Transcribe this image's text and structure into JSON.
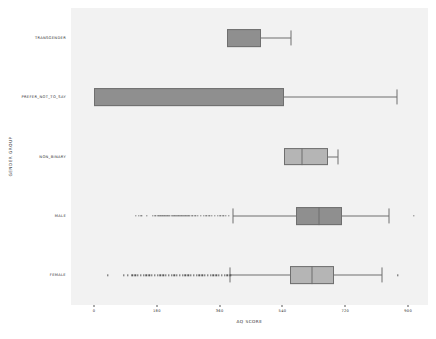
{
  "chart_data": {
    "type": "box",
    "title": "",
    "xlabel": "AQ SCORE",
    "ylabel": "GENDER GROUP",
    "orientation": "horizontal",
    "grid": false,
    "legend": null,
    "xlim": [
      -66,
      957
    ],
    "xticks": [
      0,
      180,
      360,
      540,
      720,
      900
    ],
    "xtick_labels": [
      "0",
      "180",
      "360",
      "540",
      "720",
      "900"
    ],
    "categories": [
      "TRANSGENDER",
      "PREFER_NOT_TO_SAY",
      "NON_BINARY",
      "MALE",
      "FEMALE"
    ],
    "boxes": [
      {
        "label": "TRANSGENDER",
        "whisker_low": 382,
        "q1": 382,
        "median": 382,
        "q3": 478,
        "whisker_high": 565,
        "fill": "#8f8f8f",
        "fliers": []
      },
      {
        "label": "PREFER_NOT_TO_SAY",
        "whisker_low": 0,
        "q1": 0,
        "median": 0,
        "q3": 545,
        "whisker_high": 868,
        "fill": "#8f8f8f",
        "fliers": []
      },
      {
        "label": "NON_BINARY",
        "whisker_low": 545,
        "q1": 545,
        "median": 596,
        "q3": 671,
        "whisker_high": 700,
        "fill": "#b5b5b5",
        "fliers": []
      },
      {
        "label": "MALE",
        "whisker_low": 398,
        "q1": 579,
        "median": 645,
        "q3": 711,
        "whisker_high": 846,
        "fill": "#8f8f8f",
        "fliers": [
          120,
          128,
          136,
          152,
          168,
          176,
          184,
          190,
          196,
          201,
          206,
          210,
          214,
          218,
          222,
          226,
          230,
          234,
          238,
          242,
          246,
          250,
          254,
          258,
          262,
          266,
          270,
          274,
          282,
          290,
          298,
          306,
          314,
          322,
          330,
          338,
          346,
          354,
          362,
          370,
          378,
          386,
          916
        ]
      },
      {
        "label": "FEMALE",
        "whisker_low": 390,
        "q1": 561,
        "median": 626,
        "q3": 689,
        "whisker_high": 826,
        "fill": "#b5b5b5",
        "fliers": [
          39,
          85,
          97,
          110,
          118,
          126,
          134,
          142,
          150,
          158,
          166,
          174,
          182,
          190,
          198,
          206,
          214,
          222,
          230,
          238,
          246,
          254,
          262,
          270,
          278,
          286,
          294,
          302,
          310,
          318,
          326,
          334,
          342,
          350,
          358,
          366,
          374,
          382,
          390,
          871
        ]
      }
    ],
    "plot_background": "#f2f2f2",
    "figure_background": "#ffffff",
    "line_color": "#6f6f6f"
  }
}
